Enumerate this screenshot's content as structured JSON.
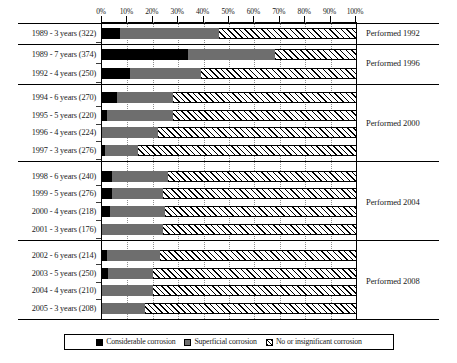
{
  "chart_data": {
    "type": "bar",
    "orientation": "horizontal",
    "stacked": true,
    "normalized_percent": true,
    "title": "",
    "xlabel": "",
    "ylabel": "",
    "xlim": [
      0,
      100
    ],
    "grid": true,
    "legend_position": "bottom",
    "xticks": [
      "0%",
      "10%",
      "20%",
      "30%",
      "40%",
      "50%",
      "60%",
      "70%",
      "80%",
      "90%",
      "100%"
    ],
    "xtick_values": [
      0,
      10,
      20,
      30,
      40,
      50,
      60,
      70,
      80,
      90,
      100
    ],
    "series": [
      {
        "name": "Considerable corrosion",
        "color": "#000000",
        "pattern": "solid",
        "values": [
          7,
          34,
          11,
          6,
          2,
          0,
          1,
          4,
          4,
          3,
          0,
          2,
          2.5,
          0,
          0
        ]
      },
      {
        "name": "Superficial corrosion",
        "color": "#6e6e6e",
        "pattern": "solid",
        "values": [
          39,
          34,
          28,
          22,
          26,
          22,
          13,
          22,
          20,
          22,
          24,
          21,
          17.5,
          20,
          17
        ]
      },
      {
        "name": "No or insignificant corrosion",
        "color": "#ffffff",
        "pattern": "diagonal-hatch",
        "values": [
          54,
          32,
          61,
          72,
          72,
          78,
          86,
          74,
          76,
          75,
          76,
          77,
          80,
          80,
          83
        ]
      }
    ],
    "categories": [
      "1989 - 3 years (322)",
      "1989 - 7 years (374)",
      "1992 - 4 years (250)",
      "1994 - 6 years (270)",
      "1995 - 5 years (220)",
      "1996 - 4 years (224)",
      "1997 - 3 years (276)",
      "1998 - 6 years (240)",
      "1999 - 5 years (276)",
      "2000 - 4 years (218)",
      "2001 - 3 years (176)",
      "2002 - 6 years (214)",
      "2003 - 5 years (250)",
      "2004 - 4 years (210)",
      "2005 - 3 years (208)"
    ],
    "group_annotations": [
      {
        "label": "Performed 1992",
        "rows": [
          0
        ]
      },
      {
        "label": "Performed 1996",
        "rows": [
          1,
          2
        ]
      },
      {
        "label": "Performed 2000",
        "rows": [
          3,
          4,
          5,
          6
        ]
      },
      {
        "label": "Performed 2004",
        "rows": [
          7,
          8,
          9,
          10
        ]
      },
      {
        "label": "Performed 2008",
        "rows": [
          11,
          12,
          13,
          14
        ]
      }
    ]
  },
  "legend": {
    "items": [
      {
        "label": "Considerable corrosion",
        "swatch": "black"
      },
      {
        "label": "Superficial corrosion",
        "swatch": "gray"
      },
      {
        "label": "No or insignificant corrosion",
        "swatch": "hatch"
      }
    ]
  },
  "colors": {
    "considerable": "#000000",
    "superficial": "#6e6e6e",
    "none": "#ffffff",
    "gridline": "#8f8f8f",
    "axis": "#000000"
  }
}
